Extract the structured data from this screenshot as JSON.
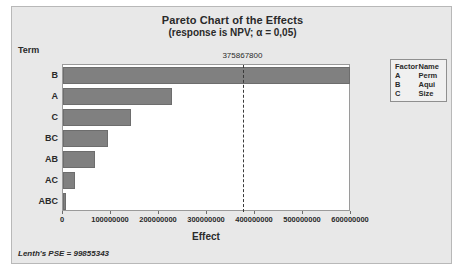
{
  "chart_data": {
    "type": "bar",
    "orientation": "horizontal",
    "title": "Pareto Chart of the Effects",
    "subtitle": "(response is NPV; α = 0,05)",
    "xlabel": "Effect",
    "ylabel": "Term",
    "categories": [
      "B",
      "A",
      "C",
      "BC",
      "AB",
      "AC",
      "ABC"
    ],
    "values": [
      598000000,
      227000000,
      142000000,
      94000000,
      67000000,
      25000000,
      7000000
    ],
    "xlim": [
      0,
      600000000
    ],
    "xticks": [
      0,
      100000000,
      200000000,
      300000000,
      400000000,
      500000000,
      600000000
    ],
    "xtick_labels": [
      "0",
      "100000000",
      "200000000",
      "300000000",
      "400000000",
      "500000000",
      "600000000"
    ],
    "grid": false,
    "reference_line": {
      "value": 375867800,
      "label": "375867800",
      "style": "dashed"
    },
    "legend": {
      "position": "right",
      "headers": [
        "Factor",
        "Name"
      ],
      "rows": [
        {
          "factor": "A",
          "name": "Perm"
        },
        {
          "factor": "B",
          "name": "Aqui"
        },
        {
          "factor": "C",
          "name": "Size"
        }
      ]
    },
    "footnote": "Lenth's PSE = 99855343",
    "colors": {
      "bar_fill": "#808080",
      "bar_border": "#6d6d6d",
      "panel_background": "#e8e8e8",
      "plot_background": "#ffffff",
      "reference_line": "#3a3a3a",
      "text": "#2a2a2a"
    }
  }
}
